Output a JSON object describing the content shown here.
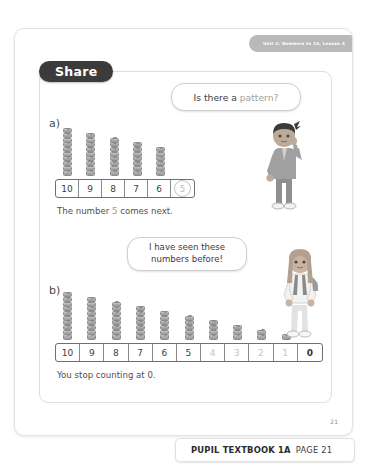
{
  "header": {
    "unit_tab": "Unit 1: Numbers to 10, Lesson 4"
  },
  "section": {
    "title": "Share"
  },
  "parts": {
    "a": {
      "label": "a)",
      "tower_heights": [
        10,
        9,
        8,
        7,
        6
      ],
      "numbers": [
        {
          "value": "10",
          "style": "normal"
        },
        {
          "value": "9",
          "style": "normal"
        },
        {
          "value": "8",
          "style": "normal"
        },
        {
          "value": "7",
          "style": "normal"
        },
        {
          "value": "6",
          "style": "normal"
        },
        {
          "value": "5",
          "style": "circled"
        }
      ],
      "caption_before": "The number ",
      "caption_highlight": "5",
      "caption_after": " comes next."
    },
    "b": {
      "label": "b)",
      "tower_heights": [
        10,
        9,
        8,
        7,
        6,
        5,
        4,
        3,
        2,
        1,
        0
      ],
      "numbers": [
        {
          "value": "10",
          "style": "normal"
        },
        {
          "value": "9",
          "style": "normal"
        },
        {
          "value": "8",
          "style": "normal"
        },
        {
          "value": "7",
          "style": "normal"
        },
        {
          "value": "6",
          "style": "normal"
        },
        {
          "value": "5",
          "style": "normal"
        },
        {
          "value": "4",
          "style": "faint"
        },
        {
          "value": "3",
          "style": "faint"
        },
        {
          "value": "2",
          "style": "faint"
        },
        {
          "value": "1",
          "style": "faint"
        },
        {
          "value": "0",
          "style": "strong"
        }
      ],
      "caption": "You stop counting at 0."
    }
  },
  "bubbles": {
    "first": {
      "text_plain": "Is there a ",
      "text_soft": "pattern?"
    },
    "second": {
      "line1": "I have seen these",
      "line2": "numbers before!"
    }
  },
  "characters": {
    "boy": "boy-character",
    "girl": "girl-character"
  },
  "footer": {
    "page_number": "21",
    "book_label": "PUPIL TEXTBOOK 1A",
    "page_label": "PAGE 21"
  },
  "colors": {
    "pill": "#3b3b3b",
    "unit_tab": "#b9b9b9",
    "cube": "#ababab",
    "faint_text": "#c5c5c5"
  }
}
